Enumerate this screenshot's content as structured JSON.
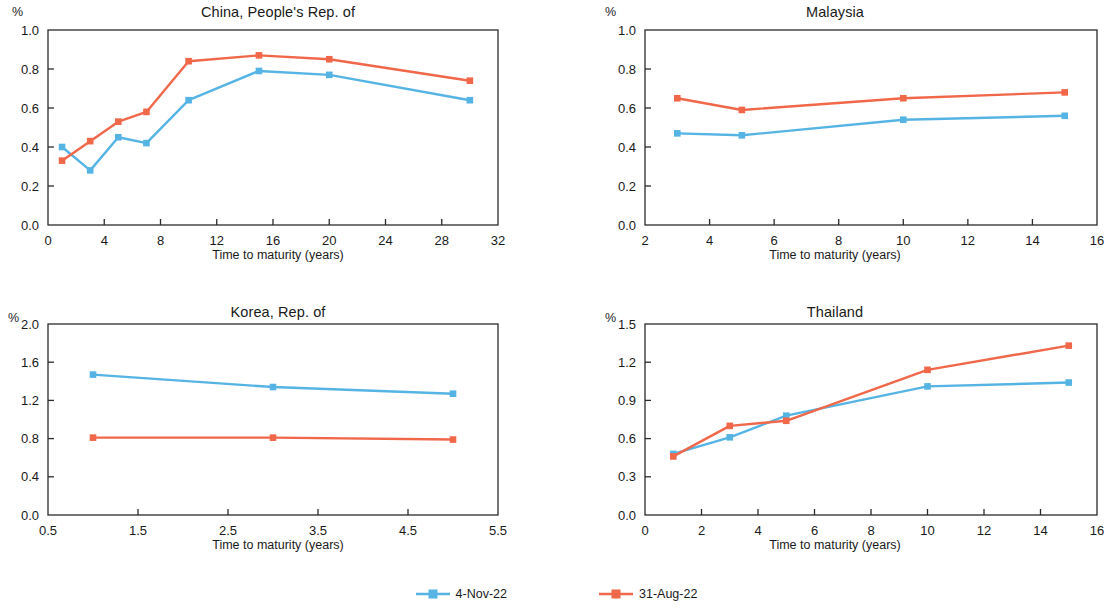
{
  "figure": {
    "axis_title": "Time to maturity (years)",
    "unit_symbol": "%"
  },
  "legend": {
    "position": "bottom-center",
    "entries": [
      {
        "label": "4-Nov-22",
        "color": "#56b4e4",
        "marker": "square"
      },
      {
        "label": "31-Aug-22",
        "color": "#f0674a",
        "marker": "square"
      }
    ]
  },
  "colors": {
    "series_blue": "#56b4e4",
    "series_orange": "#f0674a",
    "axis": "#2b2b2b",
    "text": "#1a1a1a",
    "background": "#ffffff"
  },
  "chart_data": [
    {
      "type": "line",
      "title": "China, People's Rep. of",
      "xlabel": "Time to maturity (years)",
      "ylabel": "%",
      "xlim": [
        0,
        32
      ],
      "ylim": [
        0.0,
        1.0
      ],
      "xticks": [
        0,
        4,
        8,
        12,
        16,
        20,
        24,
        28,
        32
      ],
      "yticks": [
        0.0,
        0.2,
        0.4,
        0.6,
        0.8,
        1.0
      ],
      "xtick_labels": [
        "0",
        "4",
        "8",
        "12",
        "16",
        "20",
        "24",
        "28",
        "32"
      ],
      "ytick_labels": [
        "0.0",
        "0.2",
        "0.4",
        "0.6",
        "0.8",
        "1.0"
      ],
      "grid": false,
      "x": [
        1,
        3,
        5,
        7,
        10,
        15,
        20,
        30
      ],
      "series": [
        {
          "name": "4-Nov-22",
          "color": "#56b4e4",
          "values": [
            0.4,
            0.28,
            0.45,
            0.42,
            0.64,
            0.79,
            0.77,
            0.64
          ]
        },
        {
          "name": "31-Aug-22",
          "color": "#f0674a",
          "values": [
            0.33,
            0.43,
            0.53,
            0.58,
            0.84,
            0.87,
            0.85,
            0.74
          ]
        }
      ]
    },
    {
      "type": "line",
      "title": "Malaysia",
      "xlabel": "Time to maturity (years)",
      "ylabel": "%",
      "xlim": [
        2,
        16
      ],
      "ylim": [
        0.0,
        1.0
      ],
      "xticks": [
        2,
        4,
        6,
        8,
        10,
        12,
        14,
        16
      ],
      "yticks": [
        0.0,
        0.2,
        0.4,
        0.6,
        0.8,
        1.0
      ],
      "xtick_labels": [
        "2",
        "4",
        "6",
        "8",
        "10",
        "12",
        "14",
        "16"
      ],
      "ytick_labels": [
        "0.0",
        "0.2",
        "0.4",
        "0.6",
        "0.8",
        "1.0"
      ],
      "grid": false,
      "x": [
        3,
        5,
        10,
        15
      ],
      "series": [
        {
          "name": "4-Nov-22",
          "color": "#56b4e4",
          "values": [
            0.47,
            0.46,
            0.54,
            0.56
          ]
        },
        {
          "name": "31-Aug-22",
          "color": "#f0674a",
          "values": [
            0.65,
            0.59,
            0.65,
            0.68
          ]
        }
      ]
    },
    {
      "type": "line",
      "title": "Korea, Rep. of",
      "xlabel": "Time to maturity (years)",
      "ylabel": "%",
      "xlim": [
        0.5,
        5.5
      ],
      "ylim": [
        0.0,
        2.0
      ],
      "xticks": [
        0.5,
        1.5,
        2.5,
        3.5,
        4.5,
        5.5
      ],
      "yticks": [
        0.0,
        0.4,
        0.8,
        1.2,
        1.6,
        2.0
      ],
      "xtick_labels": [
        "0.5",
        "1.5",
        "2.5",
        "3.5",
        "4.5",
        "5.5"
      ],
      "ytick_labels": [
        "0.0",
        "0.4",
        "0.8",
        "1.2",
        "1.6",
        "2.0"
      ],
      "grid": false,
      "x": [
        1,
        3,
        5
      ],
      "series": [
        {
          "name": "4-Nov-22",
          "color": "#56b4e4",
          "values": [
            1.47,
            1.34,
            1.27
          ]
        },
        {
          "name": "31-Aug-22",
          "color": "#f0674a",
          "values": [
            0.81,
            0.81,
            0.79
          ]
        }
      ]
    },
    {
      "type": "line",
      "title": "Thailand",
      "xlabel": "Time to maturity (years)",
      "ylabel": "%",
      "xlim": [
        0,
        16
      ],
      "ylim": [
        0.0,
        1.5
      ],
      "xticks": [
        0,
        2,
        4,
        6,
        8,
        10,
        12,
        14,
        16
      ],
      "yticks": [
        0.0,
        0.3,
        0.6,
        0.9,
        1.2,
        1.5
      ],
      "xtick_labels": [
        "0",
        "2",
        "4",
        "6",
        "8",
        "10",
        "12",
        "14",
        "16"
      ],
      "ytick_labels": [
        "0.0",
        "0.3",
        "0.6",
        "0.9",
        "1.2",
        "1.5"
      ],
      "grid": false,
      "x": [
        1,
        3,
        5,
        10,
        15
      ],
      "series": [
        {
          "name": "4-Nov-22",
          "color": "#56b4e4",
          "values": [
            0.48,
            0.61,
            0.78,
            1.01,
            1.04
          ]
        },
        {
          "name": "31-Aug-22",
          "color": "#f0674a",
          "values": [
            0.46,
            0.7,
            0.74,
            1.14,
            1.33
          ]
        }
      ]
    }
  ]
}
